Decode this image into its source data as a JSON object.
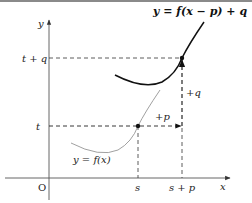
{
  "diagram": {
    "title": "y = f(x − p) + q",
    "curve_original_label": "y = f(x)",
    "axis_y_label": "y",
    "axis_x_label": "x",
    "origin_label": "O",
    "y_ticks": [
      {
        "id": "tq",
        "label": "t + q"
      },
      {
        "id": "t",
        "label": "t"
      }
    ],
    "x_ticks": [
      {
        "id": "s",
        "label": "s"
      },
      {
        "id": "sp",
        "label": "s + p"
      }
    ],
    "shift_labels": {
      "horizontal": "+p",
      "vertical": "+q"
    },
    "colors": {
      "axis": "#555555",
      "curve_shifted": "#111111",
      "curve_original": "#777777",
      "dashed": "#333333"
    }
  }
}
